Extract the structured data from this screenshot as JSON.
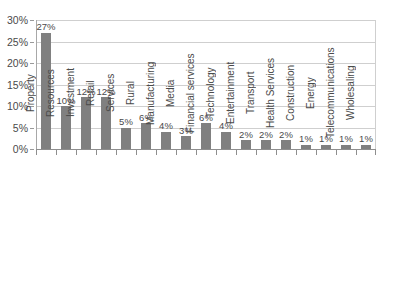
{
  "chart_data": {
    "type": "bar",
    "title": "",
    "subtitle": "",
    "xlabel": "",
    "ylabel": "",
    "ylim": [
      0,
      30
    ],
    "y_tick_labels": [
      "0%",
      "5%",
      "10%",
      "15%",
      "20%",
      "25%",
      "30%"
    ],
    "y_tick_values": [
      0,
      5,
      10,
      15,
      20,
      25,
      30
    ],
    "grid": true,
    "legend": false,
    "legend_position": "none",
    "value_suffix": "%",
    "bar_color": "#808080",
    "gridline_color": "#cfcfcf",
    "axis_color": "#8e8e8e",
    "text_color": "#4a4a4a",
    "background_color": "#ffffff",
    "categories": [
      "Property",
      "Resources",
      "Investment",
      "Retail",
      "Services",
      "Rural",
      "Manufacturing",
      "Media",
      "Financial services",
      "Technology",
      "Entertainment",
      "Transport",
      "Health Services",
      "Construction",
      "Energy",
      "Telecommunications",
      "Wholesaling"
    ],
    "values": [
      27,
      10,
      12,
      12,
      5,
      6,
      4,
      3,
      6,
      4,
      2,
      2,
      2,
      1,
      1,
      1,
      1
    ],
    "data_labels": [
      "27%",
      "10%",
      "12%",
      "12%",
      "5%",
      "6%",
      "4%",
      "3%",
      "6%",
      "4%",
      "2%",
      "2%",
      "2%",
      "1%",
      "1%",
      "1%",
      "1%"
    ]
  }
}
